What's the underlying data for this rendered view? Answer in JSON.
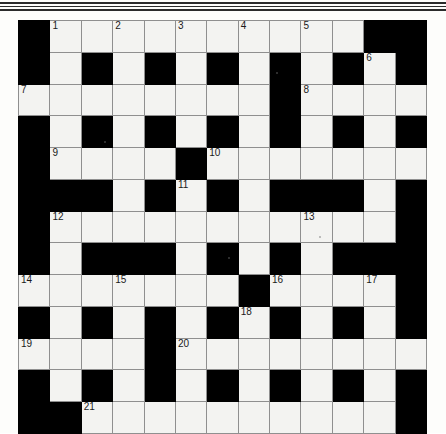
{
  "page": {
    "background_color": "#fdfdfb",
    "rule_color": "#2b2b2b"
  },
  "grid": {
    "rows": 13,
    "cols": 13,
    "cell_color": "#f3f3f1",
    "block_color": "#000000",
    "line_color": "#8f8f8f",
    "numbers_total": 21,
    "layout": [
      [
        "#",
        "1",
        ".",
        "2",
        ".",
        "3",
        ".",
        "4",
        ".",
        "5",
        ".",
        "#",
        "#"
      ],
      [
        "#",
        ".",
        "#",
        ".",
        "#",
        ".",
        "#",
        ".",
        "#",
        ".",
        "#",
        "6",
        "#"
      ],
      [
        "7",
        ".",
        ".",
        ".",
        ".",
        ".",
        ".",
        ".",
        "#",
        "8",
        ".",
        ".",
        "."
      ],
      [
        "#",
        ".",
        "#",
        ".",
        "#",
        ".",
        "#",
        ".",
        "#",
        ".",
        "#",
        ".",
        "#"
      ],
      [
        "#",
        "9",
        ".",
        ".",
        ".",
        "#",
        "10",
        ".",
        ".",
        ".",
        ".",
        ".",
        "."
      ],
      [
        "#",
        "#",
        "#",
        ".",
        "#",
        "11",
        "#",
        ".",
        "#",
        "#",
        "#",
        ".",
        "#"
      ],
      [
        "#",
        "12",
        ".",
        ".",
        ".",
        ".",
        ".",
        ".",
        ".",
        "13",
        ".",
        ".",
        "#"
      ],
      [
        "#",
        ".",
        "#",
        "#",
        "#",
        ".",
        "#",
        ".",
        "#",
        ".",
        "#",
        "#",
        "#"
      ],
      [
        "14",
        ".",
        ".",
        "15",
        ".",
        ".",
        ".",
        "#",
        "16",
        ".",
        ".",
        "17",
        "#"
      ],
      [
        "#",
        ".",
        "#",
        ".",
        "#",
        ".",
        "#",
        "18",
        "#",
        ".",
        "#",
        ".",
        "#"
      ],
      [
        "19",
        ".",
        ".",
        ".",
        "#",
        "20",
        ".",
        ".",
        ".",
        ".",
        ".",
        ".",
        "."
      ],
      [
        "#",
        ".",
        "#",
        ".",
        "#",
        ".",
        "#",
        ".",
        "#",
        ".",
        "#",
        ".",
        "#"
      ],
      [
        "#",
        "#",
        "21",
        ".",
        ".",
        ".",
        ".",
        ".",
        ".",
        ".",
        ".",
        ".",
        "#"
      ]
    ]
  }
}
